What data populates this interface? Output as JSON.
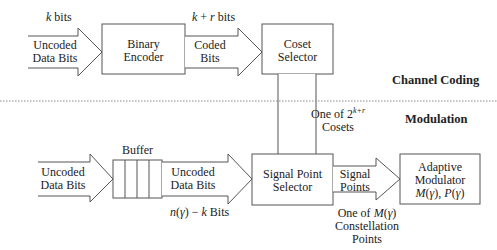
{
  "sections": {
    "channel_coding": "Channel Coding",
    "modulation": "Modulation"
  },
  "top_row": {
    "input_arrow": {
      "top_label": "k bits",
      "line1": "Uncoded",
      "line2": "Data Bits"
    },
    "binary_encoder": {
      "line1": "Binary",
      "line2": "Encoder"
    },
    "coded_arrow": {
      "top_label": "k + r bits",
      "line1": "Coded",
      "line2": "Bits"
    },
    "coset_selector": {
      "line1": "Coset",
      "line2": "Selector"
    }
  },
  "vertical_arrow": {
    "line1_prefix": "One of 2",
    "line1_sup": "k+r",
    "line2": "Cosets"
  },
  "bottom_row": {
    "input_arrow": {
      "line1": "Uncoded",
      "line2": "Data Bits"
    },
    "buffer": {
      "label": "Buffer",
      "cells": 4
    },
    "buffer_arrow": {
      "line1": "Uncoded",
      "line2": "Data Bits",
      "bottom_label": "n(γ) − k Bits"
    },
    "signal_point_selector": {
      "line1": "Signal Point",
      "line2": "Selector"
    },
    "signal_arrow": {
      "line1": "Signal",
      "line2": "Points",
      "below1": "One of M(γ)",
      "below2": "Constellation",
      "below3": "Points"
    },
    "adaptive_modulator": {
      "line1": "Adaptive",
      "line2": "Modulator",
      "line3": "M(γ), P(γ)"
    }
  },
  "colors": {
    "stroke": "#555555",
    "text": "#222222",
    "divider": "#888888"
  }
}
